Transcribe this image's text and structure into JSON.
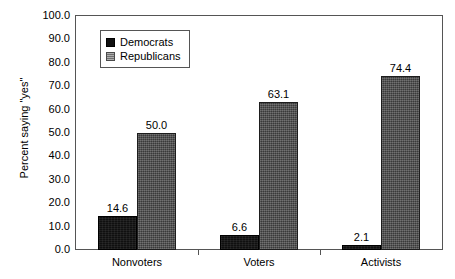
{
  "chart_data": {
    "type": "bar",
    "title": "",
    "xlabel": "",
    "ylabel": "Percent saying \"yes\"",
    "categories": [
      "Nonvoters",
      "Voters",
      "Activists"
    ],
    "series": [
      {
        "name": "Democrats",
        "values": [
          14.6,
          6.6,
          2.1
        ]
      },
      {
        "name": "Republicans",
        "values": [
          50.0,
          63.1,
          74.4
        ]
      }
    ],
    "value_labels": [
      [
        "14.6",
        "50.0"
      ],
      [
        "6.6",
        "63.1"
      ],
      [
        "2.1",
        "74.4"
      ]
    ],
    "ylim": [
      0,
      100
    ],
    "ytick_labels": [
      "0.0",
      "10.0",
      "20.0",
      "30.0",
      "40.0",
      "50.0",
      "60.0",
      "70.0",
      "80.0",
      "90.0",
      "100.0"
    ],
    "ytick_values": [
      0,
      10,
      20,
      30,
      40,
      50,
      60,
      70,
      80,
      90,
      100
    ],
    "grid": false,
    "legend_position": "top-left-inside",
    "colors": {
      "democrats": "#101010",
      "republicans": "#4a4a4a",
      "axis": "#555555",
      "background": "#ffffff",
      "text": "#000000"
    }
  },
  "legend": {
    "items": [
      {
        "label": "Democrats"
      },
      {
        "label": "Republicans"
      }
    ]
  }
}
